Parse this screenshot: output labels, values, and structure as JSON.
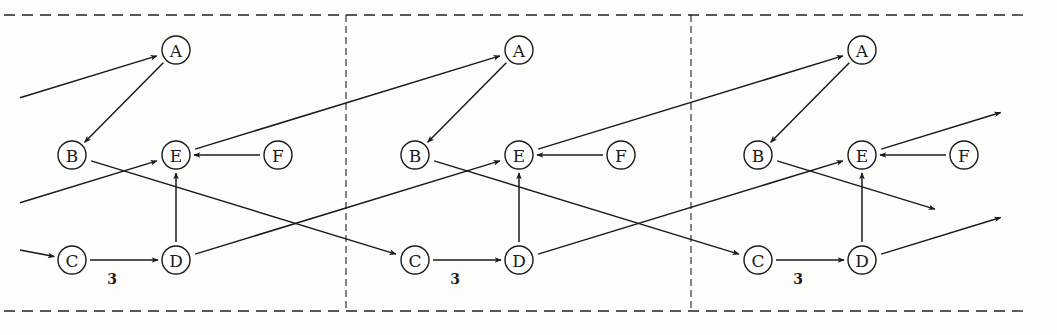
{
  "diagram": {
    "type": "unrolled-schedule-graph",
    "panel_count": 3,
    "panel_offset_x": 343,
    "frame": {
      "top_y": 15,
      "bottom_y": 311,
      "left_x": 0,
      "right_x": 1030,
      "dividers_x": [
        346,
        691
      ]
    },
    "nodes": [
      {
        "id": "A",
        "label": "A",
        "x": 176,
        "y": 50
      },
      {
        "id": "B",
        "label": "B",
        "x": 72,
        "y": 155
      },
      {
        "id": "E",
        "label": "E",
        "x": 176,
        "y": 155
      },
      {
        "id": "F",
        "label": "F",
        "x": 278,
        "y": 155
      },
      {
        "id": "C",
        "label": "C",
        "x": 72,
        "y": 260
      },
      {
        "id": "D",
        "label": "D",
        "x": 176,
        "y": 260
      }
    ],
    "intra_panel_edges": [
      {
        "from": "A",
        "to": "B"
      },
      {
        "from": "F",
        "to": "E"
      },
      {
        "from": "D",
        "to": "E"
      },
      {
        "from": "C",
        "to": "D",
        "weight": "3"
      }
    ],
    "inter_panel_edges": [
      {
        "from": "E",
        "to": "A",
        "description": "E to A of next iteration"
      },
      {
        "from": "B",
        "to": "C",
        "description": "B to C of next iteration"
      },
      {
        "from": "D",
        "to": "E",
        "description": "D to E of next iteration"
      }
    ],
    "edge_weight_label": "3",
    "node_radius": 14,
    "stroke_color": "#1a1a1a",
    "background_color": "#fdfdfc"
  }
}
